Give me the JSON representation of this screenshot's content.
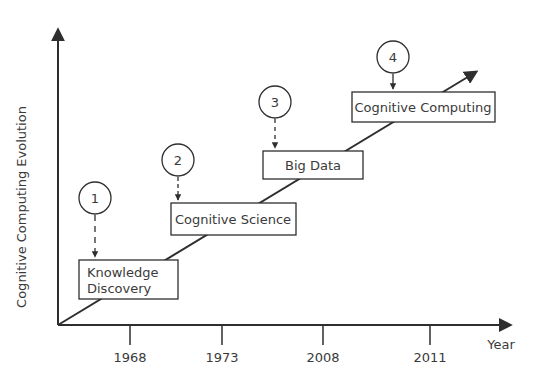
{
  "diagram": {
    "y_axis_label": "Cognitive Computing Evolution",
    "x_axis_label": "Year",
    "ticks": [
      "1968",
      "1973",
      "2008",
      "2011"
    ],
    "stages": [
      {
        "number": "1",
        "line1": "Knowledge",
        "line2": "Discovery"
      },
      {
        "number": "2",
        "line1": "Cognitive Science"
      },
      {
        "number": "3",
        "line1": "Big Data"
      },
      {
        "number": "4",
        "line1": "Cognitive Computing"
      }
    ]
  },
  "colors": {
    "line": "#2e2e2e",
    "text": "#3a3a3a",
    "background": "#ffffff"
  }
}
